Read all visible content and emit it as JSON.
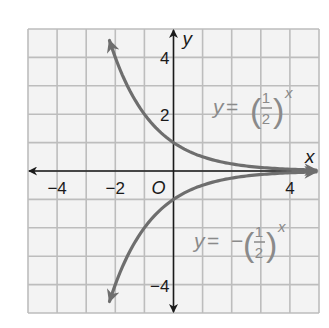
{
  "chart_data": {
    "type": "line",
    "title": "",
    "xlabel": "x",
    "ylabel": "y",
    "xlim": [
      -5,
      5
    ],
    "ylim": [
      -5,
      5
    ],
    "grid": true,
    "origin_label": "O",
    "x_ticks": [
      {
        "value": -4,
        "label": "−4"
      },
      {
        "value": -2,
        "label": "−2"
      },
      {
        "value": 4,
        "label": "4"
      }
    ],
    "y_ticks": [
      {
        "value": 4,
        "label": "4"
      },
      {
        "value": 2,
        "label": "2"
      },
      {
        "value": -4,
        "label": "−4"
      }
    ],
    "series": [
      {
        "name": "y = (1/2)^x",
        "label_prefix": "y = ",
        "label_sign": "",
        "fraction_num": "1",
        "fraction_den": "2",
        "exponent": "x",
        "sign": 1,
        "x_range": [
          -2.2,
          4.9
        ],
        "color": "#6e6e6e"
      },
      {
        "name": "y = −(1/2)^x",
        "label_prefix": "y = ",
        "label_sign": "−",
        "fraction_num": "1",
        "fraction_den": "2",
        "exponent": "x",
        "sign": -1,
        "x_range": [
          -2.2,
          4.9
        ],
        "color": "#6e6e6e"
      }
    ],
    "colors": {
      "grid": "#bdbdbd",
      "grid_fill": "#f3f3f3",
      "axis": "#1a1a1a",
      "label_gray": "#8a8a8a",
      "text": "#1a1a1a"
    }
  }
}
